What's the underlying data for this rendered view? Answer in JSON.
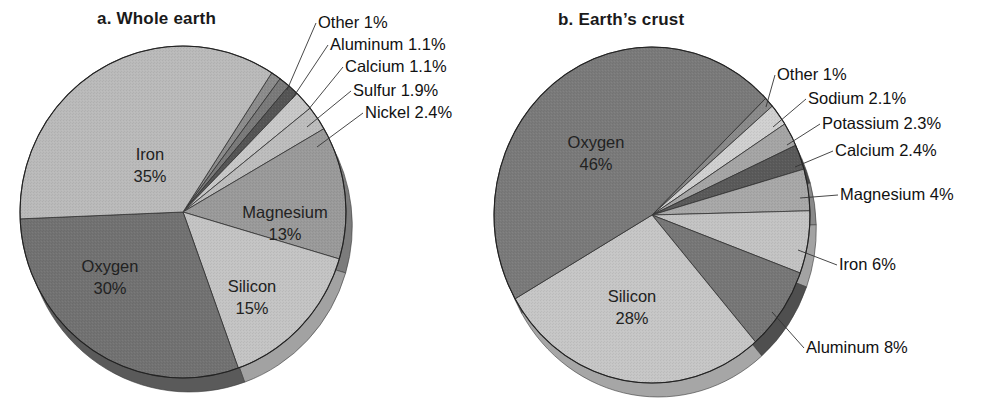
{
  "chart_data": [
    {
      "type": "pie",
      "title": "a.  Whole earth",
      "center": [
        183,
        212
      ],
      "rx": 163,
      "ry": 166,
      "depth": 14,
      "start_angle_deg": -57,
      "slices": [
        {
          "label": "Other",
          "value": 1,
          "display": "Other 1%",
          "color": "#8c8c8c",
          "rim": "#6e6e6e",
          "callout": true,
          "label_pos": [
            318,
            28
          ],
          "leader_to": [
            287,
            90
          ]
        },
        {
          "label": "Aluminum",
          "value": 1.1,
          "display": "Aluminum 1.1%",
          "color": "#7a7a7a",
          "rim": "#5e5e5e",
          "callout": true,
          "label_pos": [
            330,
            50
          ],
          "leader_to": [
            292,
            99
          ]
        },
        {
          "label": "Calcium",
          "value": 1.1,
          "display": "Calcium 1.1%",
          "color": "#555555",
          "rim": "#444444",
          "callout": true,
          "label_pos": [
            345,
            72
          ],
          "leader_to": [
            308,
            110
          ]
        },
        {
          "label": "Sulfur",
          "value": 1.9,
          "display": "Sulfur 1.9%",
          "color": "#c8c8c8",
          "rim": "#a8a8a8",
          "callout": true,
          "label_pos": [
            353,
            96
          ],
          "leader_to": [
            307,
            127
          ]
        },
        {
          "label": "Nickel",
          "value": 2.4,
          "display": "Nickel 2.4%",
          "color": "#bdbdbd",
          "rim": "#9e9e9e",
          "callout": true,
          "label_pos": [
            365,
            118
          ],
          "leader_to": [
            317,
            147
          ]
        },
        {
          "label": "Magnesium",
          "value": 13,
          "display": "Magnesium\n13%",
          "color": "#9a9a9a",
          "rim": "#7c7c7c",
          "callout": false,
          "label_pos": [
            285,
            218
          ]
        },
        {
          "label": "Silicon",
          "value": 15,
          "display": "Silicon\n15%",
          "color": "#c4c4c4",
          "rim": "#a2a2a2",
          "callout": false,
          "label_pos": [
            252,
            292
          ]
        },
        {
          "label": "Oxygen",
          "value": 30,
          "display": "Oxygen\n30%",
          "color": "#727272",
          "rim": "#5a5a5a",
          "callout": false,
          "label_pos": [
            110,
            272
          ]
        },
        {
          "label": "Iron",
          "value": 35,
          "display": "Iron\n35%",
          "color": "#bababa",
          "rim": "#9a9a9a",
          "callout": false,
          "label_pos": [
            150,
            160
          ]
        }
      ]
    },
    {
      "type": "pie",
      "title": "b.  Earth’s crust",
      "center": [
        652,
        215
      ],
      "rx": 158,
      "ry": 168,
      "depth": 14,
      "start_angle_deg": -44,
      "slices": [
        {
          "label": "Other",
          "value": 1,
          "display": "Other 1%",
          "color": "#8a8a8a",
          "rim": "#6c6c6c",
          "callout": true,
          "label_pos": [
            777,
            80
          ],
          "leader_to": [
            766,
            107
          ]
        },
        {
          "label": "Sodium",
          "value": 2.1,
          "display": "Sodium 2.1%",
          "color": "#d0d0d0",
          "rim": "#b0b0b0",
          "callout": true,
          "label_pos": [
            808,
            104
          ],
          "leader_to": [
            773,
            127
          ]
        },
        {
          "label": "Potassium",
          "value": 2.3,
          "display": "Potassium 2.3%",
          "color": "#a5a5a5",
          "rim": "#868686",
          "callout": true,
          "label_pos": [
            822,
            129
          ],
          "leader_to": [
            787,
            145
          ]
        },
        {
          "label": "Calcium",
          "value": 2.4,
          "display": "Calcium 2.4%",
          "color": "#5a5a5a",
          "rim": "#474747",
          "callout": true,
          "label_pos": [
            835,
            156
          ],
          "leader_to": [
            795,
            167
          ]
        },
        {
          "label": "Magnesium",
          "value": 4,
          "display": "Magnesium 4%",
          "color": "#a8a8a8",
          "rim": "#8a8a8a",
          "callout": true,
          "label_pos": [
            840,
            200
          ],
          "leader_to": [
            800,
            198
          ]
        },
        {
          "label": "Iron",
          "value": 6,
          "display": "Iron 6%",
          "color": "#c3c3c3",
          "rim": "#a3a3a3",
          "callout": true,
          "label_pos": [
            839,
            270
          ],
          "leader_to": [
            798,
            250
          ]
        },
        {
          "label": "Aluminum",
          "value": 8,
          "display": "Aluminum 8%",
          "color": "#777777",
          "rim": "#4f4f4f",
          "callout": true,
          "label_pos": [
            806,
            353
          ],
          "leader_to": [
            772,
            312
          ]
        },
        {
          "label": "Silicon",
          "value": 28,
          "display": "Silicon\n28%",
          "color": "#c6c6c6",
          "rim": "#a6a6a6",
          "callout": false,
          "label_pos": [
            632,
            302
          ]
        },
        {
          "label": "Oxygen",
          "value": 46,
          "display": "Oxygen\n46%",
          "color": "#7a7a7a",
          "rim": "#626262",
          "callout": false,
          "label_pos": [
            596,
            148
          ]
        }
      ]
    }
  ],
  "titles": {
    "a": "a.  Whole earth",
    "b": "b.  Earth’s crust"
  }
}
